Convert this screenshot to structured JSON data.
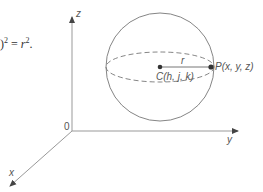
{
  "equation": {
    "lhs_fragment": ")",
    "lhs_exp": "2",
    "equals": "=",
    "rhs_base": "r",
    "rhs_exp": "2",
    "terminator": "."
  },
  "axes": {
    "z_label": "z",
    "y_label": "y",
    "x_label": "x",
    "origin_label": "0"
  },
  "sphere": {
    "radius_label": "r",
    "center_label": "C(h, j, k)",
    "point_label": "P(x, y, z)"
  },
  "colors": {
    "axis": "#888888",
    "sphere_outline": "#777777",
    "text": "#555555",
    "point": "#333333"
  }
}
